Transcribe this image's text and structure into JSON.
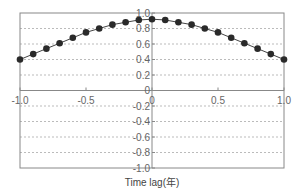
{
  "chart_data": {
    "type": "line",
    "title": "",
    "xlabel": "Time lag(年)",
    "ylabel": "",
    "xlim": [
      -1.0,
      1.0
    ],
    "ylim": [
      -1.0,
      1.0
    ],
    "grid": "horizontal dashed",
    "legend": "none",
    "x_ticks": [
      "-1.0",
      "-0.5",
      "0",
      "0.5",
      "1.0"
    ],
    "y_ticks": [
      "1.0",
      "0.8",
      "0.6",
      "0.4",
      "0.2",
      "0",
      "-0.2",
      "-0.4",
      "-0.6",
      "-0.8",
      "-1.0"
    ],
    "series": [
      {
        "name": "autocorrelation",
        "marker": "filled-circle",
        "color": "#333333",
        "x": [
          -1.0,
          -0.9,
          -0.8,
          -0.7,
          -0.6,
          -0.5,
          -0.4,
          -0.3,
          -0.2,
          -0.1,
          0.0,
          0.1,
          0.2,
          0.3,
          0.4,
          0.5,
          0.6,
          0.7,
          0.8,
          0.9,
          1.0
        ],
        "values": [
          0.4,
          0.47,
          0.54,
          0.61,
          0.68,
          0.75,
          0.8,
          0.85,
          0.88,
          0.91,
          0.92,
          0.91,
          0.88,
          0.85,
          0.8,
          0.75,
          0.68,
          0.61,
          0.54,
          0.47,
          0.4
        ]
      }
    ]
  },
  "colors": {
    "frame": "#888888",
    "grid": "#aaaaaa",
    "line": "#444444",
    "marker": "#2a2a2a",
    "text": "#666666"
  }
}
